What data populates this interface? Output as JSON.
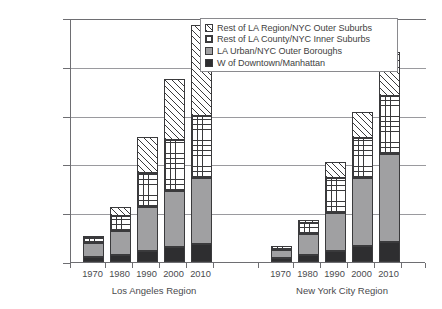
{
  "chart_data": {
    "type": "bar",
    "stacked": true,
    "title": "",
    "xlabel": "",
    "ylabel": "",
    "ylim": [
      0,
      2500000
    ],
    "ytick_labels": [
      "2,500,000",
      "2,000,000",
      "1,500,000",
      "1,000,000",
      "500,000",
      "0"
    ],
    "ytick_values": [
      2500000,
      2000000,
      1500000,
      1000000,
      500000,
      0
    ],
    "grid": true,
    "legend_position": "top-right",
    "groups": [
      {
        "label": "Los Angeles Region",
        "categories": [
          "1970",
          "1980",
          "1990",
          "2000",
          "2010"
        ]
      },
      {
        "label": "New York City Region",
        "categories": [
          "1970",
          "1980",
          "1990",
          "2000",
          "2010"
        ]
      }
    ],
    "categories": [
      "1970",
      "1980",
      "1990",
      "2000",
      "2010",
      "1970",
      "1980",
      "1990",
      "2000",
      "2010"
    ],
    "series": [
      {
        "name": "W of Downtown/Manhattan",
        "fill": "solid-dark",
        "color": "#2e2e30",
        "values": [
          50000,
          72000,
          113000,
          154000,
          184000,
          40000,
          72000,
          113000,
          164000,
          205000
        ]
      },
      {
        "name": "LA Urban/NYC Outer Boroughs",
        "fill": "solid-gray",
        "color": "#a0a0a2",
        "values": [
          145000,
          245000,
          450000,
          573000,
          676000,
          80000,
          215000,
          389000,
          696000,
          902000
        ]
      },
      {
        "name": "Rest of LA County/NYC Inner Suburbs",
        "fill": "cross-hatch",
        "color": "#ffffff",
        "values": [
          50000,
          154000,
          349000,
          523000,
          636000,
          44000,
          113000,
          358000,
          410000,
          593000
        ]
      },
      {
        "name": "Rest of LA Region/NYC Outer Suburbs",
        "fill": "diagonal-hatch",
        "color": "#ffffff",
        "values": [
          21000,
          92000,
          369000,
          625000,
          932000,
          0,
          31000,
          163000,
          267000,
          451000
        ]
      }
    ],
    "totals": [
      266000,
      563000,
      1281000,
      1875000,
      2428000,
      164000,
      400000,
      891000,
      1537000,
      2151000
    ]
  },
  "legend": {
    "items": [
      {
        "label": "Rest of LA Region/NYC Outer Suburbs",
        "swatch": "diagonal-hatch"
      },
      {
        "label": "Rest of LA County/NYC Inner Suburbs",
        "swatch": "cross-hatch"
      },
      {
        "label": "LA Urban/NYC Outer Boroughs",
        "swatch": "solid-gray"
      },
      {
        "label": "W of Downtown/Manhattan",
        "swatch": "solid-dark"
      }
    ]
  }
}
